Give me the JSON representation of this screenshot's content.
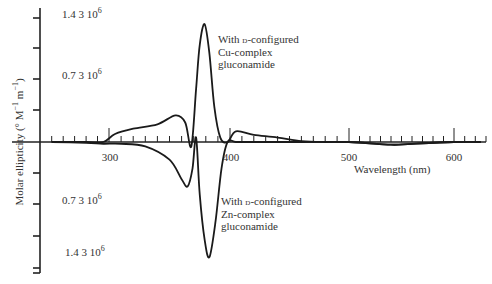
{
  "chart_data": {
    "type": "line",
    "title": "",
    "xlabel": "Wavelength (nm)",
    "ylabel": "Molar ellipticity (° M⁻¹ m⁻¹)",
    "xlim": [
      245,
      630
    ],
    "ylim": [
      -1500000.0,
      1500000.0
    ],
    "x_ticks": [
      300,
      400,
      500,
      600
    ],
    "y_ticks_labeled": [
      {
        "value": 1400000.0,
        "label": "1.4 3 10",
        "exp": "6"
      },
      {
        "value": 700000.0,
        "label": "0.7 3 10",
        "exp": "6"
      },
      {
        "value": -700000.0,
        "label": "0.7 3 10",
        "exp": "6"
      },
      {
        "value": -1400000.0,
        "label": "1.4 3 10",
        "exp": "6"
      }
    ],
    "grid": false,
    "legend_position": "inline annotations",
    "series": [
      {
        "name": "With D-configured Cu-complex gluconamide",
        "x": [
          250,
          280,
          295,
          305,
          320,
          340,
          355,
          363,
          368,
          372,
          375,
          379,
          383,
          387,
          392,
          398,
          405,
          420,
          440,
          460,
          480,
          500,
          540,
          560,
          600,
          625
        ],
        "y": [
          0,
          0,
          0,
          90000.0,
          150000.0,
          200000.0,
          300000.0,
          220000.0,
          -50000.0,
          600000.0,
          1100000.0,
          1330000.0,
          1000000.0,
          400000.0,
          50000.0,
          0,
          120000.0,
          80000.0,
          50000.0,
          10000.0,
          0,
          0,
          -30000.0,
          -20000.0,
          0,
          0
        ]
      },
      {
        "name": "With D-configured Zn-complex gluconamide",
        "x": [
          250,
          280,
          295,
          310,
          330,
          350,
          360,
          365,
          369,
          372,
          375,
          379,
          383,
          388,
          393,
          398,
          405,
          420,
          460,
          500,
          540,
          560,
          600,
          625
        ],
        "y": [
          0,
          -10000.0,
          -20000.0,
          -20000.0,
          -50000.0,
          -200000.0,
          -420000.0,
          -500000.0,
          -300000.0,
          50000.0,
          -600000.0,
          -1100000.0,
          -1300000.0,
          -900000.0,
          -300000.0,
          0,
          0,
          0,
          0,
          0,
          -30000.0,
          -20000.0,
          0,
          0
        ]
      }
    ],
    "annotations": [
      {
        "lines": [
          "With D-configured",
          "Cu-complex",
          "gluconamide"
        ]
      },
      {
        "lines": [
          "With D-configured",
          "Zn-complex",
          "gluconamide"
        ]
      }
    ]
  },
  "labels": {
    "ylabel_text": "Molar ellipticity (° M",
    "ylabel_sup1": "−1",
    "ylabel_mid": " m",
    "ylabel_sup2": "−1",
    "ylabel_end": ")",
    "xlabel": "Wavelength (nm)",
    "x300": "300",
    "x400": "400",
    "x500": "500",
    "x600": "600",
    "yt1": "1.4 3 10",
    "yt2": "0.7 3 10",
    "yt3": "0.7 3 10",
    "yt4": "1.4 3 10",
    "exp": "6",
    "cu_line1a": "With ",
    "cu_line1b": "d",
    "cu_line1c": "-configured",
    "cu_line2": "Cu-complex",
    "cu_line3": "gluconamide",
    "zn_line1a": "With ",
    "zn_line1b": "d",
    "zn_line1c": "-configured",
    "zn_line2": "Zn-complex",
    "zn_line3": "gluconamide"
  }
}
